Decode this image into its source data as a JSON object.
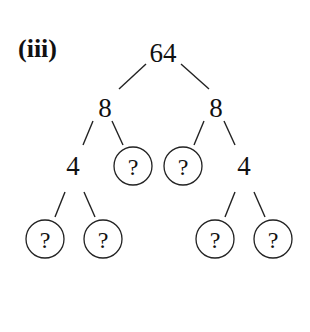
{
  "part_label": "(iii)",
  "tree": {
    "root": "64",
    "level1": [
      "8",
      "8"
    ],
    "level2": [
      "4",
      "?",
      "?",
      "4"
    ],
    "level3": [
      "?",
      "?",
      "?",
      "?"
    ]
  },
  "unknown_marker": "?"
}
